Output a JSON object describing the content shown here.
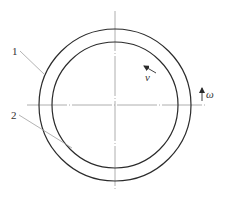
{
  "diagram": {
    "title": "",
    "colors": {
      "stroke": "#2b2b2b",
      "axis": "#9a9a9a",
      "leader": "#a0a0a0",
      "text": "#333333",
      "background": "#ffffff"
    },
    "center": {
      "x": 115,
      "y": 105
    },
    "circles": [
      {
        "id": "outer",
        "radius": 76
      },
      {
        "id": "inner",
        "radius": 63
      }
    ],
    "labels": {
      "part1": "1",
      "part2": "2",
      "velocity": "v",
      "angular_velocity": "ω"
    },
    "callouts": [
      {
        "label": "1",
        "target": "outer circle"
      },
      {
        "label": "2",
        "target": "inner circle"
      }
    ],
    "arrows": [
      {
        "name": "velocity",
        "symbol": "v",
        "direction": "tangential, counter-clockwise"
      },
      {
        "name": "angular-velocity",
        "symbol": "ω",
        "direction": "up"
      }
    ]
  }
}
